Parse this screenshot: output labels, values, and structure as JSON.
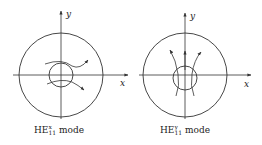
{
  "diagrams": [
    {
      "id": "left",
      "axes": {
        "x_label": "x",
        "y_label": "y"
      },
      "caption": {
        "base": "HE",
        "subscript": "11",
        "superscript": "x",
        "suffix": " mode"
      },
      "field_lines": "horizontal (x-polarized)"
    },
    {
      "id": "right",
      "axes": {
        "x_label": "x",
        "y_label": "y"
      },
      "caption": {
        "base": "HE",
        "subscript": "11",
        "superscript": "y",
        "suffix": " mode"
      },
      "field_lines": "vertical (y-polarized)"
    }
  ],
  "colors": {
    "stroke": "#333333",
    "background": "#ffffff"
  }
}
